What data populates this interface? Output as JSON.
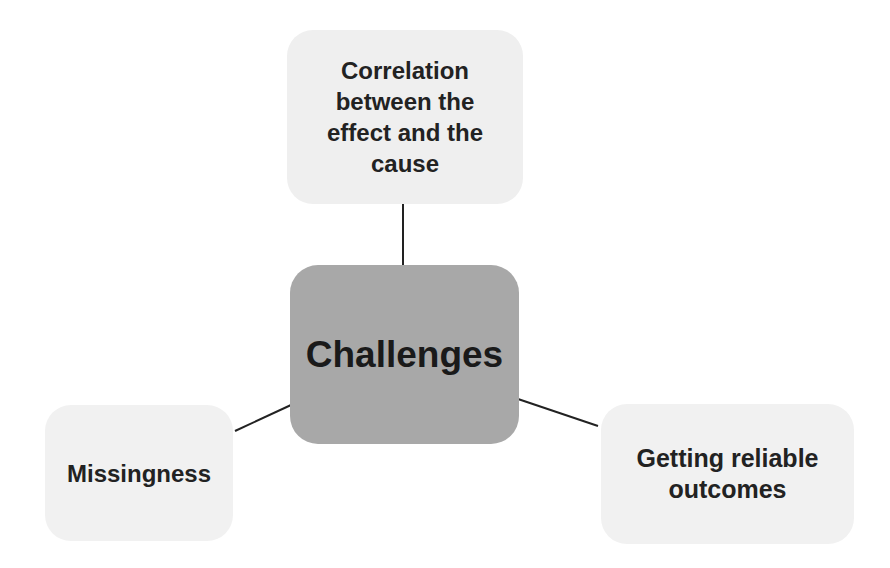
{
  "diagram": {
    "type": "mind-map",
    "center": {
      "label": "Challenges",
      "fill": "#a8a8a8"
    },
    "branches": [
      {
        "id": "top",
        "label": "Correlation between the effect and the cause",
        "lines": [
          "Correlation",
          "between the",
          "effect and the",
          "cause"
        ],
        "fill": "#efefef"
      },
      {
        "id": "left",
        "label": "Missingness",
        "fill": "#f1f1f1"
      },
      {
        "id": "right",
        "label": "Getting reliable outcomes",
        "lines": [
          "Getting reliable",
          "outcomes"
        ],
        "fill": "#f1f1f1"
      }
    ],
    "connector_color": "#222222"
  }
}
